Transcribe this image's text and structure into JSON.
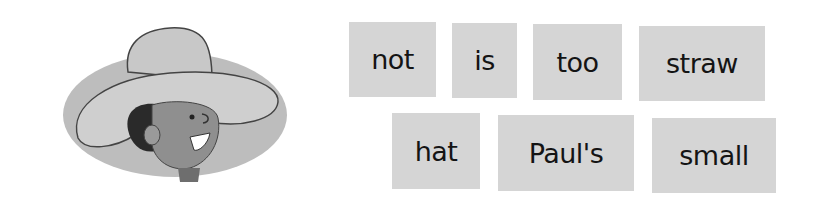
{
  "illustration": {
    "description": "boy-wearing-large-straw-hat"
  },
  "word_cards": [
    {
      "word": "not",
      "x": 349,
      "y": 22,
      "w": 87,
      "h": 75
    },
    {
      "word": "is",
      "x": 452,
      "y": 23,
      "w": 65,
      "h": 75
    },
    {
      "word": "too",
      "x": 533,
      "y": 24,
      "w": 89,
      "h": 76
    },
    {
      "word": "straw",
      "x": 639,
      "y": 26,
      "w": 126,
      "h": 75
    },
    {
      "word": "hat",
      "x": 392,
      "y": 113,
      "w": 88,
      "h": 76
    },
    {
      "word": "Paul's",
      "x": 498,
      "y": 115,
      "w": 136,
      "h": 76
    },
    {
      "word": "small",
      "x": 652,
      "y": 118,
      "w": 124,
      "h": 75
    }
  ],
  "colors": {
    "card": "#d5d5d5",
    "text": "#141414"
  }
}
